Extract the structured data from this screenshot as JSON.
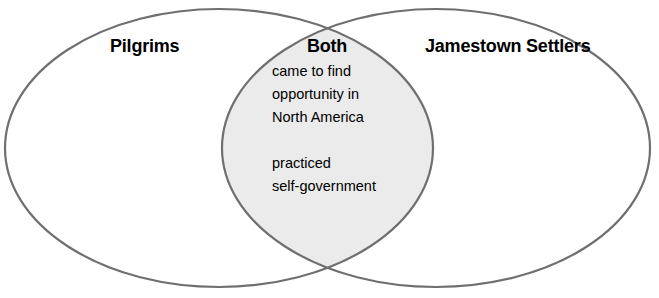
{
  "diagram": {
    "type": "venn-two-set",
    "background_color": "#ffffff",
    "stroke_color": "#6f6f6f",
    "stroke_width": 2.2,
    "intersection_fill": "#ebebeb",
    "text_color": "#000000",
    "left_set": {
      "title": "Pilgrims",
      "items": []
    },
    "right_set": {
      "title": "Jamestown Settlers",
      "items": []
    },
    "intersection": {
      "title": "Both",
      "paragraphs": [
        {
          "lines": [
            "came to find",
            "opportunity in",
            "North America"
          ]
        },
        {
          "lines": [
            "practiced",
            "self-government"
          ]
        }
      ]
    }
  }
}
